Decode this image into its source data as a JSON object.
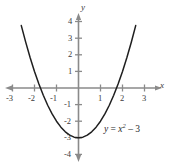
{
  "figure": {
    "background_color": "#ffffff",
    "axis_color": "#8a8a8a",
    "curve_color": "#1f1f1f",
    "text_color": "#3b3b3b"
  },
  "axes": {
    "x_axis_name": "x",
    "y_axis_name": "y",
    "x_ticks": [
      "-3",
      "-2",
      "-1",
      "1",
      "2",
      "3"
    ],
    "y_ticks": [
      "4",
      "3",
      "2",
      "1",
      "-1",
      "-2",
      "-3",
      "-4"
    ]
  },
  "equation": {
    "lhs": "y",
    "equals": "=",
    "variable": "x",
    "exponent": "2",
    "minus": "–",
    "constant": "3",
    "full_text": "y = x² – 3"
  },
  "chart_data": {
    "type": "line",
    "title": "",
    "subtitle": "",
    "xlabel": "x",
    "ylabel": "y",
    "xlim": [
      -3.4,
      3.4
    ],
    "ylim": [
      -4.4,
      4.6
    ],
    "grid": false,
    "legend": null,
    "annotations": [
      {
        "text": "y = x² – 3",
        "x": 1.2,
        "y": -2.9
      }
    ],
    "xticks": [
      -3,
      -2,
      -1,
      1,
      2,
      3
    ],
    "yticks": [
      4,
      3,
      2,
      1,
      -1,
      -2,
      -3,
      -4
    ],
    "series": [
      {
        "name": "y = x^2 - 3",
        "function": "y = x^2 - 3",
        "vertex": [
          0,
          -3
        ],
        "x_intercepts": [
          -1.732,
          1.732
        ],
        "y_intercept": -3,
        "x": [
          -2.6,
          -2.4,
          -2.2,
          -2.0,
          -1.8,
          -1.6,
          -1.4,
          -1.2,
          -1.0,
          -0.8,
          -0.6,
          -0.4,
          -0.2,
          0.0,
          0.2,
          0.4,
          0.6,
          0.8,
          1.0,
          1.2,
          1.4,
          1.6,
          1.8,
          2.0,
          2.2,
          2.4,
          2.6
        ],
        "values": [
          3.76,
          2.76,
          1.84,
          1.0,
          0.24,
          -0.44,
          -1.04,
          -1.56,
          -2.0,
          -2.36,
          -2.64,
          -2.84,
          -2.96,
          -3.0,
          -2.96,
          -2.84,
          -2.64,
          -2.36,
          -2.0,
          -1.56,
          -1.04,
          -0.44,
          0.24,
          1.0,
          1.84,
          2.76,
          3.76
        ]
      }
    ]
  }
}
